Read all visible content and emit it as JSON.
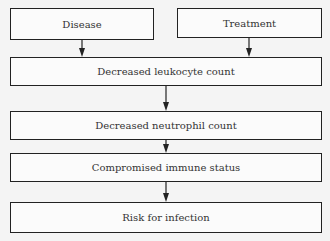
{
  "diagram": {
    "type": "flowchart",
    "nodes": [
      {
        "id": "disease",
        "label": "Disease"
      },
      {
        "id": "treatment",
        "label": "Treatment"
      },
      {
        "id": "leukocyte",
        "label": "Decreased leukocyte count"
      },
      {
        "id": "neutrophil",
        "label": "Decreased neutrophil count"
      },
      {
        "id": "immune",
        "label": "Compromised immune status"
      },
      {
        "id": "infection",
        "label": "Risk for infection"
      }
    ],
    "edges": [
      {
        "from": "disease",
        "to": "leukocyte"
      },
      {
        "from": "treatment",
        "to": "leukocyte"
      },
      {
        "from": "leukocyte",
        "to": "neutrophil"
      },
      {
        "from": "neutrophil",
        "to": "immune"
      },
      {
        "from": "immune",
        "to": "infection"
      }
    ]
  }
}
